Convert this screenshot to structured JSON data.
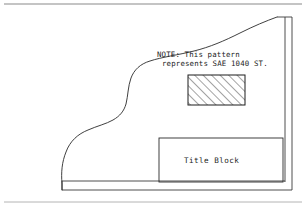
{
  "document": {
    "type": "engineering-drawing",
    "background_color": "#ffffff",
    "ink_color": "#1c1c1c",
    "width": 306,
    "height": 208
  },
  "note": {
    "line1": "NOTE: This pattern",
    "line2": "represents SAE 1040 ST.",
    "full_text": "NOTE: This pattern represents SAE 1040 ST.",
    "material_spec": "SAE 1040 ST.",
    "x": 157,
    "y1": 56,
    "y2": 65
  },
  "title_block": {
    "label": "Title Block",
    "x": 159,
    "y": 138,
    "width": 124,
    "height": 44,
    "label_x": 184,
    "label_y": 163
  },
  "hatch_swatch": {
    "name": "section-hatch-sample",
    "x": 188,
    "y": 75,
    "width": 57,
    "height": 30,
    "pattern": "diagonal-45-degree-lines",
    "line_count": 10,
    "spacing": 6,
    "angle_degrees": 45,
    "represents": "SAE 1040 ST."
  },
  "sheet_frame": {
    "top_rule_y": 4,
    "bottom_rule_y": 202,
    "right_border_outer_x": 292,
    "right_border_inner_x": 285,
    "right_border_top_y": 17,
    "base_line_upper_y": 181,
    "base_line_lower_y": 190,
    "base_line_left_x": 62
  },
  "profile_outline": {
    "name": "irregular-part-profile",
    "description": "freehand curved section outline of machined part",
    "path": "M 62 190 L 62 184 C 61 172 62 162 66 152 C 70 141 78 134 88 130 C 97 126 106 124 113 120 C 120 116 124 111 126 104 C 128 96 128 86 131 78 C 134 70 140 64 150 61 C 162 57 178 55 194 51 C 210 47 224 41 240 33 C 254 26 266 21 277 17"
  }
}
